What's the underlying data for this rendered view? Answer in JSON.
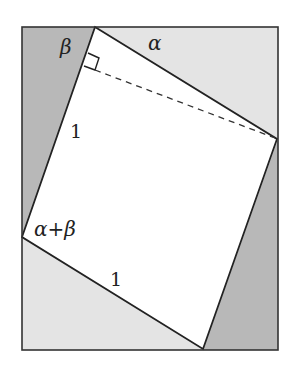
{
  "diagram": {
    "colors": {
      "background": "#ffffff",
      "dark_triangle": "#b8b8b8",
      "light_triangle": "#e4e4e4",
      "inner_square": "#ffffff",
      "stroke": "#222222"
    },
    "labels": {
      "beta_top": "β",
      "alpha_top": "α",
      "side_left": "1",
      "angle_left": "α+β",
      "side_bottom": "1"
    },
    "shapes": {
      "outer_rectangle": "outer rectangle",
      "inner_square": "rotated unit square",
      "dashed_line": "dashed diagonal segment",
      "right_angle_marker": "right angle marker"
    }
  }
}
